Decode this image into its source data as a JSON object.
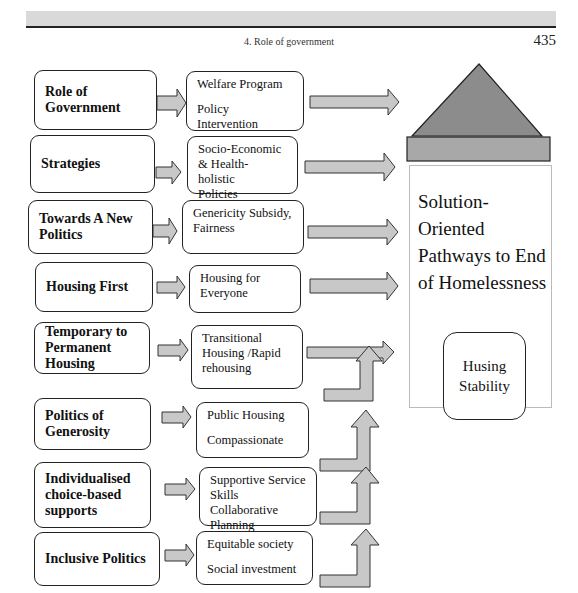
{
  "header": {
    "running_title": "4. Role of government",
    "page_number": "435"
  },
  "diagram": {
    "rows": [
      {
        "left": "Role of Government",
        "right_lines": [
          "Welfare Program",
          "Policy Intervention"
        ]
      },
      {
        "left": "Strategies",
        "right_lines": [
          "Socio-Economic",
          "& Health- holistic",
          "Policies"
        ]
      },
      {
        "left": "Towards A New Politics",
        "right_lines": [
          "Genericity Subsidy,",
          "Fairness"
        ]
      },
      {
        "left": "Housing First",
        "right_lines": [
          "Housing for",
          "Everyone"
        ]
      },
      {
        "left": "Temporary to Permanent Housing",
        "right_lines": [
          "Transitional",
          "Housing /Rapid",
          "rehousing"
        ]
      },
      {
        "left": "Politics of Generosity",
        "right_lines": [
          "Public Housing",
          "Compassionate"
        ]
      },
      {
        "left": "Individualised choice-based supports",
        "right_lines": [
          "Supportive Service",
          "Skills Collaborative",
          "Planning"
        ]
      },
      {
        "left": "Inclusive Politics",
        "right_lines": [
          "Equitable society",
          "Social investment"
        ]
      }
    ],
    "goal": {
      "title": "Solution-Oriented Pathways to End of Homelessness",
      "title_lines": [
        "Solution-",
        "Oriented",
        "Pathways to End",
        "of Homelessness"
      ],
      "outcome": "Husing Stability",
      "outcome_lines": [
        "Husing",
        "Stability"
      ]
    },
    "colors": {
      "arrow_fill": "#c8c8c8",
      "roof_fill": "#8c8c8c",
      "roof_base_fill": "#a8a8a8",
      "border": "#222222"
    }
  }
}
